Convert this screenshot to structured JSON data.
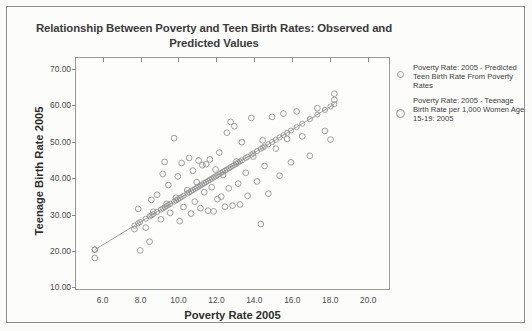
{
  "chart_data": {
    "type": "scatter",
    "title": "Relationship Between Poverty and Teen Birth Rates: Observed and Predicted Values",
    "xlabel": "Poverty Rate 2005",
    "ylabel": "Teenage Birth Rate 2005",
    "xlim": [
      4.6,
      21.2
    ],
    "ylim": [
      9.0,
      73.0
    ],
    "xticks": [
      "6.0",
      "8.0",
      "10.0",
      "12.0",
      "14.0",
      "16.0",
      "18.0",
      "20.0"
    ],
    "xtick_values": [
      6.0,
      8.0,
      10.0,
      12.0,
      14.0,
      16.0,
      18.0,
      20.0
    ],
    "yticks": [
      "10.00",
      "20.00",
      "30.00",
      "40.00",
      "50.00",
      "60.00",
      "70.00"
    ],
    "ytick_values": [
      10,
      20,
      30,
      40,
      50,
      60,
      70
    ],
    "grid": false,
    "legend_position": "right",
    "marker_color": "#8f8f8f",
    "line_color": "#8a8a8a",
    "series": [
      {
        "name": "Poverty Rate: 2005 - Teenage Birth Rate per 1,000 Women Age 15-19: 2005",
        "marker": "open-circle",
        "points": [
          [
            5.6,
            19.9
          ],
          [
            5.6,
            17.6
          ],
          [
            7.7,
            25.6
          ],
          [
            8.0,
            19.7
          ],
          [
            7.9,
            31.2
          ],
          [
            8.3,
            26.0
          ],
          [
            8.5,
            22.1
          ],
          [
            8.6,
            33.7
          ],
          [
            8.7,
            30.4
          ],
          [
            8.9,
            35.1
          ],
          [
            9.1,
            28.3
          ],
          [
            9.2,
            40.9
          ],
          [
            9.3,
            44.2
          ],
          [
            9.4,
            32.6
          ],
          [
            9.5,
            37.8
          ],
          [
            9.6,
            30.1
          ],
          [
            9.8,
            50.8
          ],
          [
            9.9,
            34.3
          ],
          [
            10.0,
            40.2
          ],
          [
            10.1,
            27.8
          ],
          [
            10.2,
            43.9
          ],
          [
            10.3,
            31.7
          ],
          [
            10.5,
            36.4
          ],
          [
            10.6,
            45.3
          ],
          [
            10.7,
            29.9
          ],
          [
            10.8,
            41.8
          ],
          [
            10.9,
            33.2
          ],
          [
            11.0,
            38.6
          ],
          [
            11.1,
            44.6
          ],
          [
            11.2,
            31.4
          ],
          [
            11.3,
            43.3
          ],
          [
            11.4,
            35.8
          ],
          [
            11.5,
            43.6
          ],
          [
            11.6,
            30.7
          ],
          [
            11.7,
            44.9
          ],
          [
            11.8,
            37.2
          ],
          [
            11.9,
            30.5
          ],
          [
            12.0,
            42.1
          ],
          [
            12.1,
            33.9
          ],
          [
            12.2,
            46.8
          ],
          [
            12.3,
            34.6
          ],
          [
            12.4,
            40.6
          ],
          [
            12.5,
            31.8
          ],
          [
            12.6,
            52.3
          ],
          [
            12.7,
            36.9
          ],
          [
            12.8,
            55.3
          ],
          [
            12.9,
            32.1
          ],
          [
            13.0,
            54.1
          ],
          [
            13.1,
            44.3
          ],
          [
            13.2,
            38.2
          ],
          [
            13.3,
            32.4
          ],
          [
            13.4,
            49.7
          ],
          [
            13.6,
            41.2
          ],
          [
            13.7,
            34.8
          ],
          [
            13.9,
            56.4
          ],
          [
            14.0,
            45.7
          ],
          [
            14.2,
            38.8
          ],
          [
            14.4,
            27.0
          ],
          [
            14.5,
            50.2
          ],
          [
            14.6,
            43.1
          ],
          [
            14.8,
            35.4
          ],
          [
            15.0,
            56.7
          ],
          [
            15.2,
            47.9
          ],
          [
            15.4,
            40.4
          ],
          [
            15.6,
            57.6
          ],
          [
            15.8,
            50.6
          ],
          [
            16.0,
            44.1
          ],
          [
            16.3,
            58.2
          ],
          [
            16.6,
            51.3
          ],
          [
            17.0,
            45.9
          ],
          [
            17.4,
            59.1
          ],
          [
            17.8,
            52.8
          ],
          [
            18.1,
            50.4
          ],
          [
            18.3,
            63.1
          ],
          [
            18.3,
            61.4
          ]
        ]
      },
      {
        "name": "Poverty Rate: 2005 - Predicted Teen Birth Rate From Poverty Rates",
        "marker": "open-circle-line",
        "slope": 1.37,
        "intercept": 2.2,
        "points": [
          [
            5.6,
            19.9
          ],
          [
            7.7,
            22.8
          ],
          [
            7.9,
            23.0
          ],
          [
            8.0,
            23.2
          ],
          [
            8.3,
            23.6
          ],
          [
            8.5,
            23.8
          ],
          [
            8.6,
            24.0
          ],
          [
            8.7,
            24.1
          ],
          [
            8.9,
            24.4
          ],
          [
            9.1,
            24.7
          ],
          [
            9.2,
            24.8
          ],
          [
            9.3,
            25.0
          ],
          [
            9.4,
            25.1
          ],
          [
            9.5,
            25.2
          ],
          [
            9.6,
            25.4
          ],
          [
            9.8,
            25.6
          ],
          [
            9.9,
            25.8
          ],
          [
            10.0,
            25.9
          ],
          [
            10.1,
            26.1
          ],
          [
            10.2,
            26.2
          ],
          [
            10.3,
            26.4
          ],
          [
            10.5,
            26.6
          ],
          [
            10.6,
            26.8
          ],
          [
            10.7,
            26.9
          ],
          [
            10.8,
            27.1
          ],
          [
            10.9,
            27.2
          ],
          [
            11.0,
            27.4
          ],
          [
            11.1,
            27.5
          ],
          [
            11.2,
            27.6
          ],
          [
            11.3,
            27.8
          ],
          [
            11.4,
            27.9
          ],
          [
            11.5,
            28.1
          ],
          [
            11.6,
            28.2
          ],
          [
            11.7,
            28.4
          ],
          [
            11.8,
            28.5
          ],
          [
            11.9,
            28.7
          ],
          [
            12.0,
            28.8
          ],
          [
            12.1,
            29.0
          ],
          [
            12.2,
            29.1
          ],
          [
            12.3,
            29.3
          ],
          [
            12.4,
            29.4
          ],
          [
            12.5,
            29.6
          ],
          [
            12.6,
            29.7
          ],
          [
            12.7,
            29.9
          ],
          [
            12.8,
            30.0
          ],
          [
            12.9,
            30.2
          ],
          [
            13.0,
            30.3
          ],
          [
            13.1,
            30.5
          ],
          [
            13.2,
            30.6
          ],
          [
            13.3,
            30.8
          ],
          [
            13.4,
            30.9
          ],
          [
            13.6,
            31.2
          ],
          [
            13.7,
            31.3
          ],
          [
            13.9,
            31.6
          ],
          [
            14.0,
            31.7
          ],
          [
            14.2,
            32.0
          ],
          [
            14.4,
            32.3
          ],
          [
            14.5,
            32.4
          ],
          [
            14.6,
            32.6
          ],
          [
            14.8,
            32.8
          ],
          [
            15.0,
            33.1
          ],
          [
            15.2,
            33.4
          ],
          [
            15.4,
            33.6
          ],
          [
            15.6,
            33.9
          ],
          [
            15.8,
            34.2
          ],
          [
            16.0,
            34.4
          ],
          [
            16.3,
            34.8
          ],
          [
            16.6,
            35.2
          ],
          [
            17.0,
            35.8
          ],
          [
            17.4,
            36.3
          ],
          [
            17.8,
            36.9
          ],
          [
            18.1,
            37.3
          ],
          [
            18.3,
            60.2
          ]
        ]
      }
    ],
    "regression_line": {
      "x_start": 5.6,
      "y_start": 19.9,
      "x_end": 18.3,
      "y_end": 60.2
    }
  },
  "legend": {
    "entries": [
      {
        "label": "Poverty Rate: 2005 - Predicted Teen Birth Rate From Poverty Rates",
        "marker": "open-circle"
      },
      {
        "label": "Poverty Rate: 2005 - Teenage Birth Rate per 1,000 Women Age 15-19: 2005",
        "marker": "open-circle"
      }
    ]
  }
}
